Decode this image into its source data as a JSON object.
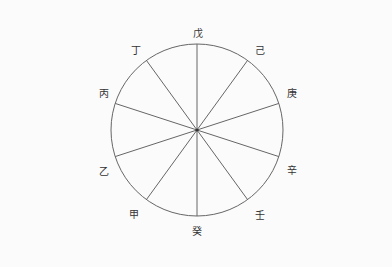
{
  "diagram": {
    "type": "wheel",
    "center": [
      197,
      130
    ],
    "radius": 86,
    "stroke_color": "#666666",
    "labels": [
      {
        "text": "戊",
        "x": 198,
        "y": 32
      },
      {
        "text": "己",
        "x": 260,
        "y": 49
      },
      {
        "text": "庚",
        "x": 292,
        "y": 92
      },
      {
        "text": "辛",
        "x": 292,
        "y": 169
      },
      {
        "text": "壬",
        "x": 260,
        "y": 214
      },
      {
        "text": "癸",
        "x": 197,
        "y": 230
      },
      {
        "text": "甲",
        "x": 134,
        "y": 213
      },
      {
        "text": "乙",
        "x": 104,
        "y": 170
      },
      {
        "text": "丙",
        "x": 104,
        "y": 92
      },
      {
        "text": "丁",
        "x": 136,
        "y": 49
      }
    ],
    "spoke_angles_deg": [
      0,
      36,
      72,
      108,
      144,
      180,
      216,
      252,
      288,
      324
    ]
  }
}
